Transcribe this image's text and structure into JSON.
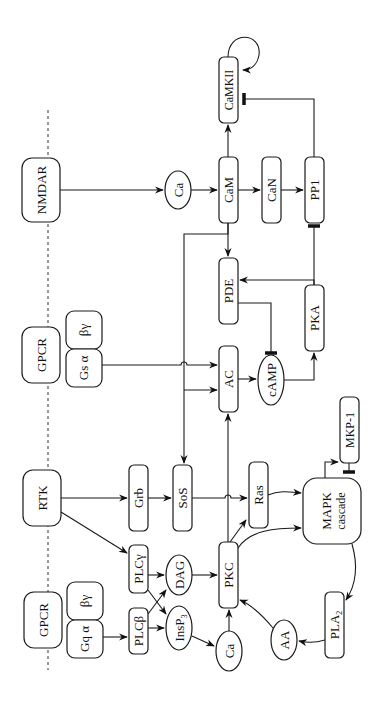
{
  "diagram": {
    "orientation": "rotated-counterclockwise-90",
    "membrane_line": "dashed",
    "colors": {
      "stroke": "#1a1a1a",
      "text": "#111111",
      "background": "#ffffff"
    },
    "receptors": {
      "nmdar": "NMDAR",
      "gpcr_s": "GPCR",
      "rtk": "RTK",
      "gpcr_q": "GPCR"
    },
    "g_proteins": {
      "gs_alpha": "Gs α",
      "gs_betagamma": "βγ",
      "gq_alpha": "Gq α",
      "gq_betagamma": "βγ"
    },
    "nodes": {
      "ca_top": "Ca",
      "cam": "CaM",
      "can": "CaN",
      "pp1": "PP1",
      "camkii": "CaMKII",
      "pde": "PDE",
      "pka": "PKA",
      "ac": "AC",
      "camp": "cAMP",
      "grb": "Grb",
      "sos": "SoS",
      "ras": "Ras",
      "mapk_line1": "MAPK",
      "mapk_line2": "cascade",
      "mkp1": "MKP-1",
      "plcg": "PLCγ",
      "plcb": "PLCβ",
      "dag": "DAG",
      "insp3": "InsP",
      "insp3_sub": "3",
      "pkc": "PKC",
      "ca_bottom": "Ca",
      "aa": "AA",
      "pla2": "PLA",
      "pla2_sub": "2"
    },
    "edges": [
      {
        "from": "NMDAR",
        "to": "Ca",
        "type": "activation"
      },
      {
        "from": "Ca",
        "to": "CaM",
        "type": "activation"
      },
      {
        "from": "CaM",
        "to": "CaN",
        "type": "activation"
      },
      {
        "from": "CaN",
        "to": "PP1",
        "type": "activation"
      },
      {
        "from": "CaM",
        "to": "CaMKII",
        "type": "activation"
      },
      {
        "from": "CaMKII",
        "to": "CaMKII",
        "type": "autophosphorylation"
      },
      {
        "from": "PP1",
        "to": "CaMKII",
        "type": "inhibition"
      },
      {
        "from": "CaM",
        "to": "PDE",
        "type": "activation"
      },
      {
        "from": "CaM",
        "to": "AC",
        "type": "activation"
      },
      {
        "from": "CaM",
        "to": "SoS",
        "type": "activation"
      },
      {
        "from": "Gs α",
        "to": "AC",
        "type": "activation"
      },
      {
        "from": "AC",
        "to": "cAMP",
        "type": "activation"
      },
      {
        "from": "PDE",
        "to": "cAMP",
        "type": "inhibition"
      },
      {
        "from": "cAMP",
        "to": "PKA",
        "type": "activation"
      },
      {
        "from": "PKA",
        "to": "PDE",
        "type": "activation"
      },
      {
        "from": "PKA",
        "to": "PP1",
        "type": "inhibition"
      },
      {
        "from": "RTK",
        "to": "Grb",
        "type": "activation"
      },
      {
        "from": "Grb",
        "to": "SoS",
        "type": "activation"
      },
      {
        "from": "SoS",
        "to": "Ras",
        "type": "activation"
      },
      {
        "from": "RTK",
        "to": "PLCγ",
        "type": "activation"
      },
      {
        "from": "Gq α",
        "to": "PLCβ",
        "type": "activation"
      },
      {
        "from": "PLCγ",
        "to": "DAG",
        "type": "activation"
      },
      {
        "from": "PLCγ",
        "to": "InsP3",
        "type": "activation"
      },
      {
        "from": "PLCβ",
        "to": "DAG",
        "type": "activation"
      },
      {
        "from": "PLCβ",
        "to": "InsP3",
        "type": "activation"
      },
      {
        "from": "InsP3",
        "to": "Ca",
        "type": "activation"
      },
      {
        "from": "DAG",
        "to": "PKC",
        "type": "activation"
      },
      {
        "from": "Ca",
        "to": "PKC",
        "type": "activation"
      },
      {
        "from": "PKC",
        "to": "AC",
        "type": "activation"
      },
      {
        "from": "PKC",
        "to": "Ras",
        "type": "activation"
      },
      {
        "from": "PKC",
        "to": "MAPK cascade",
        "type": "activation"
      },
      {
        "from": "Ras",
        "to": "MAPK cascade",
        "type": "activation"
      },
      {
        "from": "MAPK cascade",
        "to": "MKP-1",
        "type": "activation"
      },
      {
        "from": "MKP-1",
        "to": "MAPK cascade",
        "type": "inhibition"
      },
      {
        "from": "MAPK cascade",
        "to": "PLA2",
        "type": "activation"
      },
      {
        "from": "PLA2",
        "to": "AA",
        "type": "activation"
      },
      {
        "from": "AA",
        "to": "PKC",
        "type": "activation"
      }
    ]
  }
}
